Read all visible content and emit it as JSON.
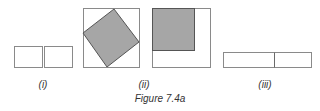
{
  "figure": {
    "caption": "Figure 7.4a",
    "colors": {
      "stroke": "#7a7a7a",
      "fill_shaded": "#a6a6a6",
      "stroke_dark": "#555555",
      "background": "#ffffff"
    },
    "panels": [
      {
        "label": "(i)",
        "description": "Two adjacent equal rectangles",
        "shapes": [
          {
            "type": "rect",
            "x": 14,
            "y": 46,
            "w": 28,
            "h": 21
          },
          {
            "type": "rect",
            "x": 44,
            "y": 46,
            "w": 28,
            "h": 21
          }
        ]
      },
      {
        "label": "(ii)",
        "description": "Square with inscribed tilted shaded square",
        "shapes": [
          {
            "type": "rect",
            "x": 83,
            "y": 8,
            "w": 56,
            "h": 59
          },
          {
            "type": "polygon",
            "points": "114,9 139,42 107,67 83,33",
            "shaded": true
          }
        ]
      },
      {
        "label": "",
        "description": "Square with shaded square in top-left corner",
        "shapes": [
          {
            "type": "rect",
            "x": 152,
            "y": 8,
            "w": 58,
            "h": 59
          },
          {
            "type": "rect",
            "x": 152,
            "y": 8,
            "w": 42,
            "h": 42,
            "shaded": true
          }
        ]
      },
      {
        "label": "(iii)",
        "description": "Long rectangle divided into two parts",
        "shapes": [
          {
            "type": "rect",
            "x": 223,
            "y": 52,
            "w": 88,
            "h": 15
          },
          {
            "type": "line",
            "x1": 274,
            "y1": 52,
            "x2": 274,
            "y2": 67
          }
        ]
      }
    ]
  }
}
